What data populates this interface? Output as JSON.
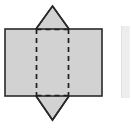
{
  "figure": {
    "kind": "geometry-net-diagram",
    "canvas": {
      "width": 131,
      "height": 128,
      "background": "#ffffff"
    },
    "colors": {
      "fill": "#d2d2d2",
      "solid_stroke": "#2a2a2a",
      "dashed_stroke": "#1f1f1f",
      "page_edge_strip": "#ededed",
      "background": "#ffffff"
    },
    "shapes": [
      {
        "name": "rectangle",
        "type": "rect",
        "x": 5,
        "y": 29,
        "width": 97,
        "height": 67,
        "fill": "#d2d2d2",
        "stroke": "#2a2a2a",
        "stroke_width": 1.6,
        "stroke_style": "solid"
      },
      {
        "name": "rhombus",
        "type": "polygon",
        "points": "52.5,6 69,29 69,96 52.5,120 36,96 36,29",
        "apex_top": {
          "x": 52.5,
          "y": 6
        },
        "apex_bottom": {
          "x": 52.5,
          "y": 120
        },
        "left_x": 36,
        "right_x": 69,
        "fill": "#d2d2d2",
        "stroke": "#2a2a2a",
        "stroke_width": 1.6,
        "stroke_style": "solid"
      }
    ],
    "hidden_edges": [
      {
        "name": "hidden-edge-left-vertical",
        "x1": 36.5,
        "y1": 29,
        "x2": 36.5,
        "y2": 96,
        "style": "dashed",
        "dash_pattern": "5,4",
        "stroke": "#1f1f1f",
        "stroke_width": 1.7
      },
      {
        "name": "hidden-edge-right-vertical",
        "x1": 68.5,
        "y1": 29,
        "x2": 68.5,
        "y2": 96,
        "style": "dashed",
        "dash_pattern": "5,4",
        "stroke": "#1f1f1f",
        "stroke_width": 1.7
      },
      {
        "name": "hidden-edge-top-horizontal",
        "x1": 36.5,
        "y1": 29.5,
        "x2": 68.5,
        "y2": 29.5,
        "style": "dashed",
        "dash_pattern": "5,4",
        "stroke": "#1f1f1f",
        "stroke_width": 1.7
      },
      {
        "name": "hidden-edge-bottom-horizontal",
        "x1": 36.5,
        "y1": 95.5,
        "x2": 68.5,
        "y2": 95.5,
        "style": "dashed",
        "dash_pattern": "5,4",
        "stroke": "#1f1f1f",
        "stroke_width": 1.7
      }
    ],
    "page_edge": {
      "name": "page-edge-strip",
      "x": 121,
      "y": 26,
      "width": 7,
      "height": 72,
      "color": "#ededed"
    }
  }
}
